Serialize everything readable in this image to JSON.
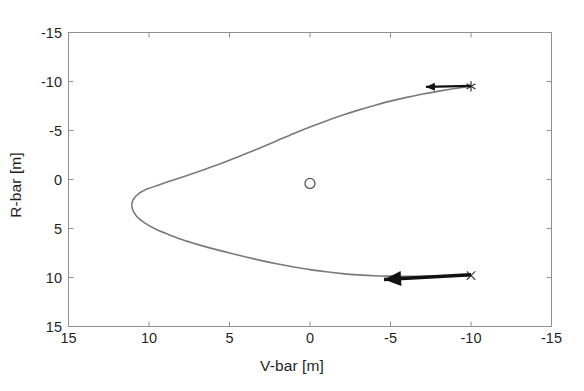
{
  "figure": {
    "background_color": "#ffffff",
    "axes_color": "#808080",
    "curve_color": "#7a7a7a",
    "marker_color": "#4d4d4d",
    "arrow_color": "#111111",
    "text_color": "#1f1f1f"
  },
  "axis_labels": {
    "x": "V-bar [m]",
    "y": "R-bar [m]"
  },
  "ticks": {
    "x": [
      "15",
      "10",
      "5",
      "0",
      "-5",
      "-10",
      "-15"
    ],
    "y": [
      "-15",
      "-10",
      "-5",
      "0",
      "5",
      "10",
      "15"
    ]
  },
  "chart_data": {
    "type": "line",
    "title": "",
    "xlabel": "V-bar [m]",
    "ylabel": "R-bar [m]",
    "xlim": [
      15,
      -15
    ],
    "ylim": [
      -15,
      15
    ],
    "x_reversed": true,
    "y_reversed": true,
    "xticks": [
      15,
      10,
      5,
      0,
      -5,
      -10,
      -15
    ],
    "yticks": [
      -15,
      -10,
      -5,
      0,
      5,
      10,
      15
    ],
    "grid": false,
    "legend": null,
    "series": [
      {
        "name": "relative trajectory",
        "type": "line",
        "color": "#7a7a7a",
        "linewidth": 1.6,
        "points": [
          [
            -10.0,
            -9.5
          ],
          [
            -9.0,
            -9.28
          ],
          [
            -8.0,
            -9.02
          ],
          [
            -7.0,
            -8.72
          ],
          [
            -6.0,
            -8.38
          ],
          [
            -5.0,
            -8.0
          ],
          [
            -4.0,
            -7.56
          ],
          [
            -3.0,
            -7.08
          ],
          [
            -2.0,
            -6.55
          ],
          [
            -1.0,
            -5.98
          ],
          [
            0.0,
            -5.36
          ],
          [
            1.0,
            -4.7
          ],
          [
            2.0,
            -4.0
          ],
          [
            3.0,
            -3.3
          ],
          [
            4.0,
            -2.62
          ],
          [
            5.0,
            -1.96
          ],
          [
            6.0,
            -1.34
          ],
          [
            7.0,
            -0.76
          ],
          [
            8.0,
            -0.2
          ],
          [
            9.0,
            0.33
          ],
          [
            10.0,
            0.9
          ],
          [
            10.6,
            1.4
          ],
          [
            11.0,
            2.1
          ],
          [
            11.05,
            2.9
          ],
          [
            10.8,
            3.7
          ],
          [
            10.3,
            4.4
          ],
          [
            9.6,
            5.05
          ],
          [
            8.8,
            5.6
          ],
          [
            8.0,
            6.1
          ],
          [
            7.0,
            6.62
          ],
          [
            6.0,
            7.08
          ],
          [
            5.0,
            7.5
          ],
          [
            4.0,
            7.9
          ],
          [
            3.0,
            8.28
          ],
          [
            2.0,
            8.62
          ],
          [
            1.0,
            8.92
          ],
          [
            0.0,
            9.2
          ],
          [
            -1.0,
            9.42
          ],
          [
            -2.0,
            9.6
          ],
          [
            -3.0,
            9.73
          ],
          [
            -4.0,
            9.82
          ],
          [
            -5.0,
            9.86
          ],
          [
            -6.0,
            9.88
          ],
          [
            -7.0,
            9.87
          ],
          [
            -8.0,
            9.85
          ],
          [
            -9.0,
            9.82
          ],
          [
            -10.0,
            9.8
          ]
        ]
      }
    ],
    "markers": [
      {
        "name": "start-marker",
        "symbol": "asterisk",
        "x": -10.0,
        "y": -9.5,
        "color": "#333333"
      },
      {
        "name": "target-marker",
        "symbol": "circle",
        "x": 0.0,
        "y": 0.4,
        "color": "#555555"
      },
      {
        "name": "end-marker",
        "symbol": "cross",
        "x": -10.0,
        "y": 9.8,
        "color": "#444444"
      }
    ],
    "annotations": [
      {
        "name": "upper-velocity-arrow",
        "type": "arrow",
        "from": [
          -10.0,
          -9.55
        ],
        "to": [
          -7.2,
          -9.45
        ],
        "color": "#111111",
        "linewidth": 2.4,
        "head_size": "small"
      },
      {
        "name": "lower-velocity-arrow",
        "type": "arrow",
        "from": [
          -10.0,
          9.72
        ],
        "to": [
          -4.6,
          10.2
        ],
        "color": "#111111",
        "linewidth": 3.4,
        "head_size": "large"
      }
    ]
  }
}
